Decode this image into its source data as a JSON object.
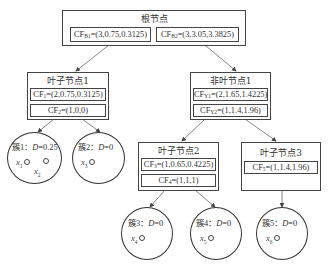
{
  "root": {
    "title": "根节点",
    "entries": [
      {
        "prefix": "CF",
        "sub": "B1",
        "value": "=(3,0.75,0.3125)"
      },
      {
        "prefix": "CF",
        "sub": "B2",
        "value": "=(3,3.05,3.3825)"
      }
    ]
  },
  "leaf1": {
    "title": "叶子节点1",
    "entries": [
      {
        "prefix": "CF",
        "sub": "1",
        "value": "=(2,0.75,0.3125)"
      },
      {
        "prefix": "CF",
        "sub": "2",
        "value": "=(1,0,0)"
      }
    ]
  },
  "nonleaf1": {
    "title": "非叶节点1",
    "entries": [
      {
        "prefix": "CF",
        "sub": "Y1",
        "value": "=(2,1.65,1.4225)"
      },
      {
        "prefix": "CF",
        "sub": "Y2",
        "value": "=(1,1.4,1.96)"
      }
    ]
  },
  "leaf2": {
    "title": "叶子节点2",
    "entries": [
      {
        "prefix": "CF",
        "sub": "3",
        "value": "=(1,0.65,0.4225)"
      },
      {
        "prefix": "CF",
        "sub": "4",
        "value": "=(1,1,1)"
      }
    ]
  },
  "leaf3": {
    "title": "叶子节点3",
    "entries": [
      {
        "prefix": "CF",
        "sub": "5",
        "value": "=(1,1.4,1.96)"
      }
    ]
  },
  "clusters": [
    {
      "name": "簇1：",
      "dvar": "D",
      "dval": "=0.25",
      "points": [
        {
          "x": "x",
          "sub": "1"
        },
        {
          "x": "x",
          "sub": "2"
        }
      ]
    },
    {
      "name": "簇2：",
      "dvar": "D",
      "dval": "=0",
      "points": [
        {
          "x": "x",
          "sub": "3"
        }
      ]
    },
    {
      "name": "簇3：",
      "dvar": "D",
      "dval": "=0",
      "points": [
        {
          "x": "x",
          "sub": "4"
        }
      ]
    },
    {
      "name": "簇4：",
      "dvar": "D",
      "dval": "=0",
      "points": [
        {
          "x": "x",
          "sub": "5"
        }
      ]
    },
    {
      "name": "簇5：",
      "dvar": "D",
      "dval": "=0",
      "points": [
        {
          "x": "x",
          "sub": "6"
        }
      ]
    }
  ],
  "colors": {
    "stroke": "#444444",
    "text": "#333333",
    "background": "#ffffff"
  }
}
